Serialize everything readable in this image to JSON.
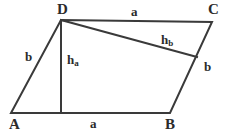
{
  "figure": {
    "kind": "parallelogram-with-heights",
    "background_color": "#ffffff",
    "stroke_color": "#3a3a3a",
    "text_color": "#2b2b2b",
    "vertices": [
      {
        "name": "A",
        "label": "A",
        "x": 11,
        "y": 113
      },
      {
        "name": "B",
        "label": "B",
        "x": 170,
        "y": 113
      },
      {
        "name": "C",
        "label": "C",
        "x": 212,
        "y": 22
      },
      {
        "name": "D",
        "label": "D",
        "x": 61,
        "y": 20
      }
    ],
    "edges": [
      {
        "name": "AB",
        "from": "A",
        "to": "B",
        "label": "a"
      },
      {
        "name": "BC",
        "from": "B",
        "to": "C",
        "label": "b"
      },
      {
        "name": "CD",
        "from": "C",
        "to": "D",
        "label": "a"
      },
      {
        "name": "DA",
        "from": "D",
        "to": "A",
        "label": "b"
      }
    ],
    "heights": [
      {
        "name": "h_a",
        "label": "h",
        "subscript": "a",
        "from_x": 61,
        "from_y": 20,
        "to_x": 61,
        "to_y": 113
      },
      {
        "name": "h_b",
        "label": "h",
        "subscript": "b",
        "from_x": 61,
        "from_y": 20,
        "to_x": 197,
        "to_y": 57
      }
    ],
    "labels": {
      "vertex_a": "A",
      "vertex_b": "B",
      "vertex_c": "C",
      "vertex_d": "D",
      "side_a_top": "a",
      "side_a_bottom": "a",
      "side_b_left": "b",
      "side_b_right": "b",
      "height_a_base": "h",
      "height_a_sub": "a",
      "height_b_base": "h",
      "height_b_sub": "b"
    }
  }
}
